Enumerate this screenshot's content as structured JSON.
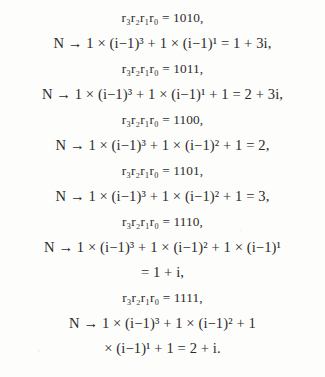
{
  "document": {
    "type": "scanned-mathematics-excerpt",
    "background_color": "#fdfdfc",
    "text_color": "#2b2b2b",
    "equations": [
      {
        "id": "r-1010",
        "kind": "assignment",
        "text": "r₃r₂r₁r₀ = 1010,"
      },
      {
        "id": "n-1010",
        "kind": "expansion",
        "text": "N → 1 × (i−1)³ + 1 × (i−1)¹ = 1 + 3i,"
      },
      {
        "id": "r-1011",
        "kind": "assignment",
        "text": "r₃r₂r₁r₀ = 1011,"
      },
      {
        "id": "n-1011",
        "kind": "expansion",
        "text": "N → 1 × (i−1)³ + 1 × (i−1)¹ + 1 = 2 + 3i,"
      },
      {
        "id": "r-1100",
        "kind": "assignment",
        "text": "r₃r₂r₁r₀ = 1100,"
      },
      {
        "id": "n-1100",
        "kind": "expansion",
        "text": "N → 1 × (i−1)³ + 1 × (i−1)² + 1 = 2,"
      },
      {
        "id": "r-1101",
        "kind": "assignment",
        "text": "r₃r₂r₁r₀ = 1101,"
      },
      {
        "id": "n-1101",
        "kind": "expansion",
        "text": "N → 1 × (i−1)³ + 1 × (i−1)² + 1 = 3,"
      },
      {
        "id": "r-1110",
        "kind": "assignment",
        "text": "r₃r₂r₁r₀ = 1110,"
      },
      {
        "id": "n-1110",
        "kind": "expansion",
        "text": "N → 1 × (i−1)³ + 1 × (i−1)² + 1 × (i−1)¹"
      },
      {
        "id": "n-1110-cont",
        "kind": "continuation",
        "text": "= 1 + i,"
      },
      {
        "id": "r-1111",
        "kind": "assignment",
        "text": "r₃r₂r₁r₀ = 1111,"
      },
      {
        "id": "n-1111",
        "kind": "expansion",
        "text": "N → 1 × (i−1)³ + 1 × (i−1)² + 1"
      },
      {
        "id": "n-1111-cont",
        "kind": "continuation",
        "text": "× (i−1)¹ + 1 = 2 + i."
      }
    ]
  }
}
